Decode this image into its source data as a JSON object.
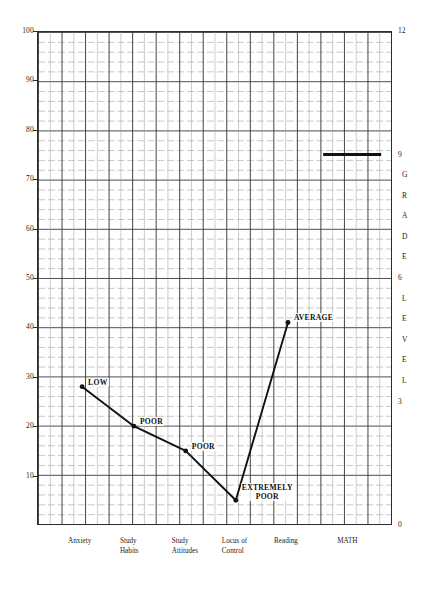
{
  "chart_data": {
    "type": "line",
    "title": "",
    "subtitle": "",
    "xlabel": "",
    "ylabel": "",
    "right_axis_label": "GRADE LEVEL",
    "grid": true,
    "legend_position": "none",
    "ylim": [
      0,
      100
    ],
    "right_ylim": [
      0,
      12
    ],
    "categories": [
      "Anxiety",
      "Study Habits",
      "Study Attitudes",
      "Locus of Control",
      "Reading",
      "MATH"
    ],
    "category_lines": [
      [
        "Anxiety"
      ],
      [
        "Study",
        "Habits"
      ],
      [
        "Study",
        "Attitudes"
      ],
      [
        "Locus of",
        "Control"
      ],
      [
        "Reading"
      ],
      [
        "MATH"
      ]
    ],
    "series": [
      {
        "name": "Student profile",
        "values": [
          28,
          20,
          15,
          5,
          41,
          null
        ],
        "point_labels": [
          "LOW",
          "POOR",
          "POOR",
          "EXTREMELY POOR",
          "AVERAGE",
          null
        ]
      }
    ],
    "annotations": [
      {
        "text": "LOW",
        "value": 28,
        "category": "Anxiety"
      },
      {
        "text": "POOR",
        "value": 20,
        "category": "Study Habits"
      },
      {
        "text": "POOR",
        "value": 15,
        "category": "Study Attitudes"
      },
      {
        "text": "EXTREMELY POOR",
        "lines": [
          "EXTREMELY",
          "POOR"
        ],
        "value": 5,
        "category": "Locus of Control"
      },
      {
        "text": "AVERAGE",
        "value": 41,
        "category": "Reading"
      }
    ],
    "math_bar": {
      "value": 75,
      "grade_equivalent": 9,
      "category": "MATH"
    },
    "y_ticks": [
      100,
      90,
      80,
      70,
      60,
      50,
      40,
      30,
      20,
      10
    ],
    "y_minor_step": 2,
    "right_ticks": [
      12,
      9,
      6,
      3,
      0
    ],
    "right_letters": [
      "G",
      "R",
      "A",
      "D",
      "E",
      "L",
      "E",
      "V",
      "E",
      "L"
    ],
    "colors": {
      "line": "#111111",
      "grid_major": "#3a3a3a",
      "grid_minor": "#9a9a9a",
      "frame": "#2b2b2b",
      "text": "#242424",
      "background": "#ffffff"
    }
  }
}
